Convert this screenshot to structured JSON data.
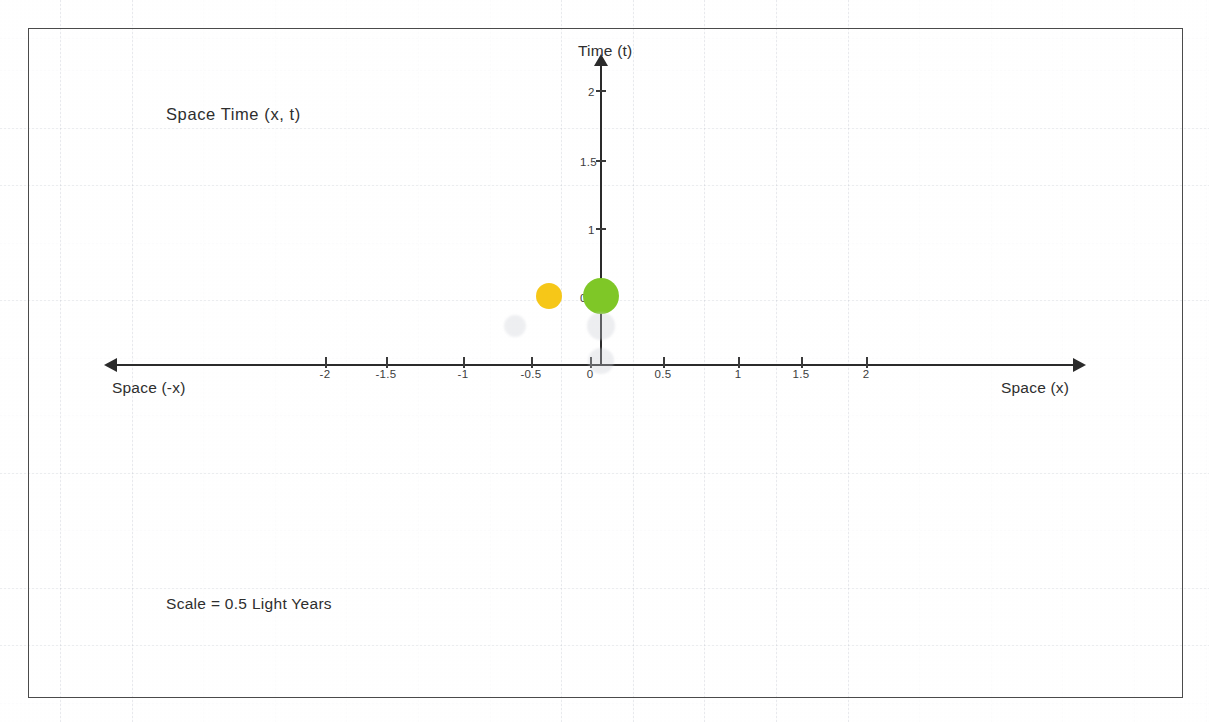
{
  "document": {
    "type": "hand-annotated spacetime diagram scan",
    "background_color": "#fefefe",
    "frame_color": "#4a4a4a",
    "grid_color": "#7882961f"
  },
  "labels": {
    "title": "Space  Time  (x, t)",
    "scale_note": "Scale = 0.5 Light Years",
    "axis_time": "Time (t)",
    "axis_space_positive": "Space (x)",
    "axis_space_negative": "Space (-x)"
  },
  "chart_data": {
    "type": "scatter",
    "title": "Space  Time  (x, t)",
    "xlabel": "Space (x)",
    "ylabel": "Time (t)",
    "xlim": [
      -2.35,
      2.35
    ],
    "ylim": [
      -0.12,
      2.2
    ],
    "grid": true,
    "legend": "none",
    "annotations": [
      "Space  Time  (x, t)",
      "Scale = 0.5 Light Years",
      "Space (-x)",
      "Space (x)",
      "Time (t)"
    ],
    "x_ticks": [
      {
        "value": -2,
        "label": "-2",
        "px": 325
      },
      {
        "value": -1.5,
        "label": "-1.5",
        "px": 386
      },
      {
        "value": -1,
        "label": "-1",
        "px": 463
      },
      {
        "value": -0.5,
        "label": "-0.5",
        "px": 531
      },
      {
        "value": 0,
        "label": "0",
        "px": 590
      },
      {
        "value": 0.5,
        "label": "0.5",
        "px": 663
      },
      {
        "value": 1,
        "label": "1",
        "px": 738
      },
      {
        "value": 1.5,
        "label": "1.5",
        "px": 801
      },
      {
        "value": 2,
        "label": "2",
        "px": 866
      }
    ],
    "y_ticks": [
      {
        "value": 0.5,
        "label": "0.5",
        "px": 296
      },
      {
        "value": 1,
        "label": "1",
        "px": 228
      },
      {
        "value": 1.5,
        "label": "1.5",
        "px": 160
      },
      {
        "value": 2,
        "label": "2",
        "px": 90
      }
    ],
    "points": [
      {
        "name": "event-green",
        "x": 0.0,
        "t": 0.5,
        "color": "#7fc727",
        "radius_px": 18,
        "opacity": 1.0
      },
      {
        "name": "event-yellow",
        "x": -0.38,
        "t": 0.5,
        "color": "#f6c718",
        "radius_px": 13,
        "opacity": 1.0
      },
      {
        "name": "ghost-left",
        "x": -0.62,
        "t": 0.28,
        "color": "#c9ccd4",
        "radius_px": 11,
        "opacity": 0.3
      },
      {
        "name": "ghost-center",
        "x": 0.0,
        "t": 0.28,
        "color": "#c9ccd4",
        "radius_px": 14,
        "opacity": 0.33
      },
      {
        "name": "ghost-origin",
        "x": 0.0,
        "t": 0.02,
        "color": "#c9ccd4",
        "radius_px": 13,
        "opacity": 0.33
      }
    ]
  }
}
